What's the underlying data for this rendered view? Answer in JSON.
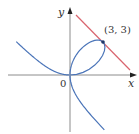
{
  "figure": {
    "width": 139,
    "height": 134,
    "origin_px": [
      70,
      75
    ],
    "scale_px_per_unit": 11,
    "colors": {
      "axis": "#8c8c8c",
      "curve": "#4a74b8",
      "tangent": "#d9646e",
      "point": "#1f3a6b",
      "text": "#333333"
    },
    "labels": {
      "y_axis": "y",
      "x_axis": "x",
      "origin": "0",
      "point": "(3, 3)"
    }
  },
  "chart_data": {
    "type": "line",
    "title": "",
    "xlabel": "x",
    "ylabel": "y",
    "xlim": [
      -6.3,
      5.9
    ],
    "ylim": [
      -5.3,
      6.8
    ],
    "grid": false,
    "series": [
      {
        "name": "curve x^3 + y^3 = 6xy (folium)",
        "equation": "x^3 + y^3 = 6xy",
        "color": "#4a74b8"
      },
      {
        "name": "tangent line x + y = 6",
        "equation": "x + y = 6",
        "x_range": [
          0.55,
          5.45
        ],
        "color": "#d9646e"
      }
    ],
    "annotations": [
      {
        "text": "(3, 3)",
        "x": 3,
        "y": 3,
        "marker": "point"
      },
      {
        "text": "0",
        "x": 0,
        "y": 0
      }
    ]
  }
}
